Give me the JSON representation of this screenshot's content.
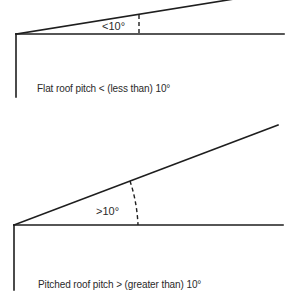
{
  "diagrams": [
    {
      "id": "flat-roof",
      "angle_label": "<10°",
      "caption": "Flat roof pitch < (less than) 10°",
      "angle_condition": "less than 10 degrees"
    },
    {
      "id": "pitched-roof",
      "angle_label": ">10°",
      "caption": "Pitched roof pitch > (greater than) 10°",
      "angle_condition": "greater than 10 degrees"
    }
  ],
  "colors": {
    "line": "#1e1e1e",
    "text": "#2a2a2a",
    "background": "#ffffff"
  }
}
